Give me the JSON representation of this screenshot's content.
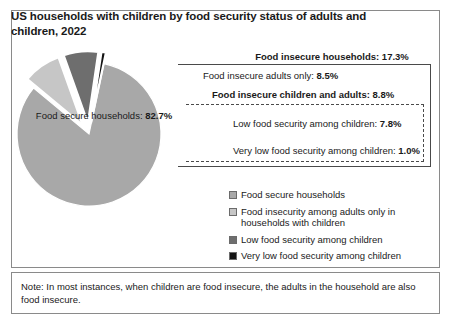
{
  "chart_title": "US  households with children by food security status of adults and children, 2022",
  "note": {
    "text": "Note: In most instances, when children are food insecure, the adults in the household are also food insecure."
  },
  "callouts": {
    "insecure_total": "Food insecure households: 17.3%",
    "adults_only_label": "Food insecure adults only:",
    "adults_only_value": "8.5%",
    "children_and_adults_label": "Food insecure children and adults:",
    "children_and_adults_value": "8.8%",
    "low_security_label": "Low food security among children:",
    "low_security_value": "7.8%",
    "very_low_security_label": "Very low food security among children:",
    "very_low_security_value": "1.0%"
  },
  "pie_center_label": {
    "label": "Food secure households:",
    "value": "82.7%"
  },
  "legend": {
    "items": [
      {
        "label": "Food secure households",
        "color": "#a8a8a8"
      },
      {
        "label": "Food insecurity among adults only in households with children",
        "color": "#c6c6c6"
      },
      {
        "label": "Low food security among children",
        "color": "#6e6e6e"
      },
      {
        "label": "Very low food security among children",
        "color": "#141414"
      }
    ]
  },
  "chart_data": {
    "type": "pie",
    "title": "US  households with children by food security status of adults and children, 2022",
    "unit": "percent",
    "categories": [
      "Food secure households",
      "Food insecurity among adults only in households with children",
      "Low food security among children",
      "Very low food security among children"
    ],
    "values": [
      82.7,
      8.5,
      7.8,
      1.0
    ],
    "colors": [
      "#a8a8a8",
      "#c6c6c6",
      "#6e6e6e",
      "#141414"
    ],
    "exploded": [
      false,
      true,
      true,
      true
    ],
    "groups": [
      {
        "name": "Food insecure households",
        "value": 17.3
      },
      {
        "name": "Food insecure children and adults",
        "value": 8.8
      }
    ],
    "legend_position": "right",
    "grid": false
  }
}
